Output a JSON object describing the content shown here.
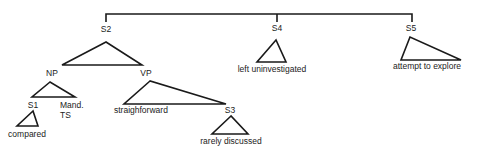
{
  "diagram": {
    "type": "tree",
    "nodes": {
      "s2": "S2",
      "s4": "S4",
      "s5": "S5",
      "np": "NP",
      "vp": "VP",
      "s1": "S1",
      "mand": "Mand.",
      "ts": "TS",
      "s3": "S3"
    },
    "leaves": {
      "s4": "left uninvestigated",
      "s5": "attempt to explore",
      "s1": "compared",
      "vp_left": "straighforward",
      "s3": "rarely discussed"
    },
    "line_color": "#1a1a1a"
  }
}
